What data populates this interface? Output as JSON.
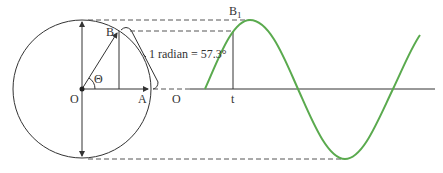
{
  "diagram": {
    "labels": {
      "center_left": "O",
      "point_b": "B",
      "point_a": "A",
      "angle": "Θ",
      "origin_right": "O",
      "radian_note": "1 radian = 57.3°",
      "peak_label": "B",
      "peak_subscript": "1",
      "time_label": "t"
    },
    "colors": {
      "line": "#333333",
      "sine": "#5aaa4e",
      "dash": "#555555"
    }
  }
}
